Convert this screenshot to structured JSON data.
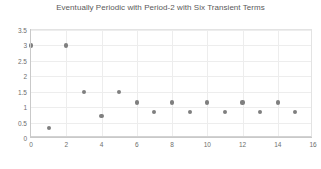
{
  "chart_data": {
    "type": "scatter",
    "title": "Eventually Periodic with Period-2 with Six Transient Terms",
    "xlabel": "",
    "ylabel": "",
    "xlim": [
      0,
      16
    ],
    "ylim": [
      0,
      3.5
    ],
    "grid": true,
    "legend": "none",
    "marker_color": "#7f7f7f",
    "xticks": [
      0,
      2,
      4,
      6,
      8,
      10,
      12,
      14,
      16
    ],
    "xtick_labels": [
      "0",
      "2",
      "4",
      "6",
      "8",
      "10",
      "12",
      "14",
      "16"
    ],
    "yticks": [
      0,
      0.5,
      1,
      1.5,
      2,
      2.5,
      3,
      3.5
    ],
    "ytick_labels": [
      "0",
      "0.5",
      "1",
      "1.5",
      "2",
      "2.5",
      "3",
      "3.5"
    ],
    "x": [
      0,
      1,
      2,
      3,
      4,
      5,
      6,
      7,
      8,
      9,
      10,
      11,
      12,
      13,
      14,
      15
    ],
    "values": [
      3,
      0.33,
      3,
      1.5,
      0.7,
      1.5,
      1.15,
      0.85,
      1.15,
      0.85,
      1.15,
      0.85,
      1.15,
      0.85,
      1.15,
      0.85
    ],
    "points": [
      {
        "x": 0,
        "y": 3
      },
      {
        "x": 1,
        "y": 0.33
      },
      {
        "x": 2,
        "y": 3
      },
      {
        "x": 3,
        "y": 1.5
      },
      {
        "x": 4,
        "y": 0.7
      },
      {
        "x": 5,
        "y": 1.5
      },
      {
        "x": 6,
        "y": 1.15
      },
      {
        "x": 7,
        "y": 0.85
      },
      {
        "x": 8,
        "y": 1.15
      },
      {
        "x": 9,
        "y": 0.85
      },
      {
        "x": 10,
        "y": 1.15
      },
      {
        "x": 11,
        "y": 0.85
      },
      {
        "x": 12,
        "y": 1.15
      },
      {
        "x": 13,
        "y": 0.85
      },
      {
        "x": 14,
        "y": 1.15
      },
      {
        "x": 15,
        "y": 0.85
      }
    ]
  }
}
